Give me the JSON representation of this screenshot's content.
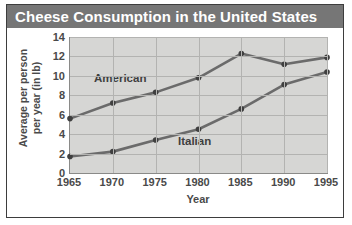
{
  "chart_data": {
    "type": "line",
    "title": "Cheese Consumption in the United States",
    "xlabel": "Year",
    "ylabel_line1": "Average per person",
    "ylabel_line2": "per year (in lb)",
    "categories": [
      "1965",
      "1970",
      "1975",
      "1980",
      "1985",
      "1990",
      "1995"
    ],
    "x": [
      1965,
      1970,
      1975,
      1980,
      1985,
      1990,
      1995
    ],
    "series": [
      {
        "name": "American",
        "values": [
          5.6,
          7.2,
          8.3,
          9.8,
          12.3,
          11.2,
          11.9
        ]
      },
      {
        "name": "Italian",
        "values": [
          1.7,
          2.2,
          3.4,
          4.5,
          6.6,
          9.1,
          10.4
        ]
      }
    ],
    "ylim": [
      0,
      14
    ],
    "yticks": [
      "14",
      "12",
      "10",
      "8",
      "6",
      "4",
      "2",
      "0"
    ],
    "ytick_values": [
      14,
      12,
      10,
      8,
      6,
      4,
      2,
      0
    ],
    "xlim": [
      1965,
      1995
    ],
    "grid": true,
    "legend": "inline-labels",
    "colors": {
      "title_bar": "#767676",
      "title_text": "#ffffff",
      "plot_background": "#d6d6d4",
      "gridline": "#b3b3b1",
      "line": "#6b6b6b",
      "marker": "#3f3f3f",
      "axis_text": "#4a4a4a",
      "frame": "#3d3d3d"
    }
  }
}
